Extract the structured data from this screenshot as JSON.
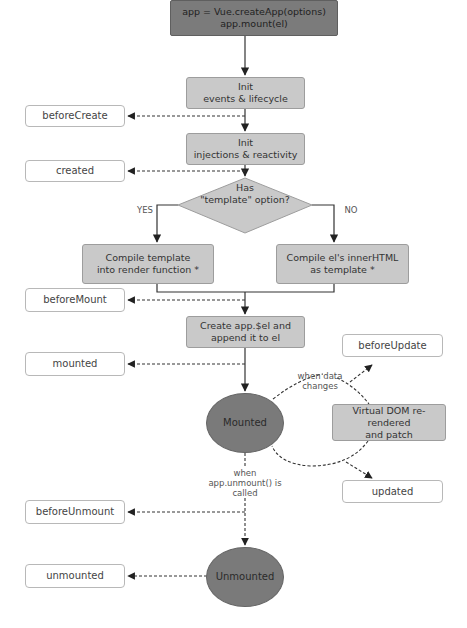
{
  "diagram": {
    "colors": {
      "start_node": "#7b7b7b",
      "process_node": "#c9c9c9",
      "state_node": "#7a7a7a",
      "hook_node": "#ffffff",
      "line": "#333333"
    },
    "start": {
      "line1": "app = Vue.createApp(options)",
      "line2": "app.mount(el)"
    },
    "steps": {
      "init_events": {
        "line1": "Init",
        "line2": "events & lifecycle"
      },
      "init_injections": {
        "line1": "Init",
        "line2": "injections & reactivity"
      },
      "compile_template": {
        "line1": "Compile template",
        "line2": "into render function *"
      },
      "compile_el": {
        "line1": "Compile el's innerHTML",
        "line2": "as template *"
      },
      "create_el": {
        "line1": "Create app.$el and",
        "line2": "append it to el"
      },
      "vdom": {
        "line1": "Virtual DOM re-rendered",
        "line2": "and patch"
      }
    },
    "decision": {
      "line1": "Has",
      "line2": "\"template\" option?",
      "yes_label": "YES",
      "no_label": "NO"
    },
    "states": {
      "mounted": "Mounted",
      "unmounted": "Unmounted"
    },
    "hooks": {
      "beforeCreate": "beforeCreate",
      "created": "created",
      "beforeMount": "beforeMount",
      "mounted": "mounted",
      "beforeUpdate": "beforeUpdate",
      "updated": "updated",
      "beforeUnmount": "beforeUnmount",
      "unmounted": "unmounted"
    },
    "annotations": {
      "data_changes_1": "when data",
      "data_changes_2": "changes",
      "unmount_1": "when",
      "unmount_2": "app.unmount() is",
      "unmount_3": "called"
    }
  }
}
